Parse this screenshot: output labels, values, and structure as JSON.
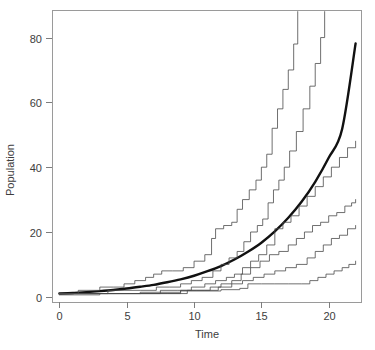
{
  "chart_data": {
    "type": "line",
    "title": "",
    "xlabel": "Time",
    "ylabel": "Population",
    "xlim": [
      -0.55,
      22.4
    ],
    "ylim": [
      -1.6,
      88.5
    ],
    "xticks": [
      0,
      5,
      10,
      15,
      20
    ],
    "xticklabels": [
      "0",
      "5",
      "10",
      "15",
      "20"
    ],
    "yticks": [
      0,
      20,
      40,
      60,
      80
    ],
    "yticklabels": [
      "0",
      "20",
      "40",
      "60",
      "80"
    ],
    "grid": false,
    "legend": null,
    "frame": "box",
    "background": "#ffffff",
    "colors": {
      "simulation_line": "#4a4a4a",
      "mean_line": "#111111",
      "axis": "#7d7d7d",
      "text": "#3d3d3d"
    },
    "series": [
      {
        "name": "Deterministic mean (exponential)",
        "kind": "smooth",
        "linewidth": 2.4,
        "color": "#111111",
        "x": [
          0,
          1,
          2,
          3,
          4,
          5,
          6,
          7,
          8,
          9,
          10,
          11,
          12,
          13,
          14,
          15,
          16,
          17,
          18,
          19,
          20,
          21,
          22
        ],
        "values": [
          1.0,
          1.2,
          1.45,
          1.75,
          2.1,
          2.55,
          3.1,
          3.7,
          4.5,
          5.4,
          6.5,
          7.9,
          9.5,
          11.5,
          13.9,
          16.7,
          20.2,
          24.4,
          29.4,
          35.5,
          42.9,
          51.8,
          78.2
        ]
      },
      {
        "name": "Simulation 1 (fastest)",
        "kind": "step",
        "linewidth": 0.8,
        "color": "#4a4a4a",
        "x": [
          0,
          1.0,
          1.4,
          2.2,
          3.0,
          4.0,
          4.8,
          5.6,
          6.4,
          7.0,
          7.6,
          8.4,
          9.2,
          10.0,
          10.8,
          11.3,
          11.6,
          12.2,
          12.8,
          13.2,
          13.6,
          14.1,
          14.6,
          15.0,
          15.4,
          15.8,
          16.2,
          16.6,
          17.0,
          17.4,
          17.7
        ],
        "values": [
          1,
          1,
          2,
          2,
          3,
          3,
          4,
          5,
          6,
          7,
          8,
          8,
          9,
          11,
          13,
          18,
          21,
          22,
          23,
          27,
          30,
          33,
          36,
          40,
          44,
          52,
          58,
          64,
          70,
          78,
          88
        ]
      },
      {
        "name": "Simulation 2",
        "kind": "step",
        "linewidth": 0.8,
        "color": "#4a4a4a",
        "x": [
          0,
          1.2,
          2.5,
          3.6,
          4.8,
          6.0,
          7.2,
          8.2,
          9.0,
          9.8,
          10.6,
          11.4,
          12.0,
          12.6,
          13.2,
          13.7,
          14.2,
          14.7,
          15.1,
          15.5,
          15.9,
          16.3,
          16.7,
          17.1,
          17.6,
          18.1,
          18.6,
          19.0,
          19.4,
          19.7
        ],
        "values": [
          1,
          1,
          1,
          2,
          2,
          2,
          3,
          3,
          4,
          5,
          6,
          8,
          10,
          12,
          14,
          17,
          20,
          22,
          24,
          29,
          33,
          36,
          40,
          45,
          51,
          58,
          65,
          72,
          80,
          88
        ]
      },
      {
        "name": "Simulation 3",
        "kind": "step",
        "linewidth": 0.8,
        "color": "#4a4a4a",
        "x": [
          0,
          1.5,
          3.0,
          4.5,
          6.0,
          7.5,
          8.8,
          9.8,
          10.8,
          11.6,
          12.4,
          13.0,
          13.6,
          14.2,
          14.8,
          15.4,
          16.0,
          16.6,
          17.2,
          17.8,
          18.4,
          19.0,
          19.6,
          20.2,
          20.8,
          21.4,
          22.0
        ],
        "values": [
          1,
          1,
          1,
          1,
          1,
          2,
          2,
          3,
          4,
          5,
          6,
          7,
          9,
          11,
          13,
          16,
          21,
          23,
          25,
          28,
          31,
          34,
          37,
          40,
          43,
          46,
          48
        ]
      },
      {
        "name": "Simulation 4",
        "kind": "step",
        "linewidth": 0.8,
        "color": "#4a4a4a",
        "x": [
          0,
          1.5,
          3.0,
          4.5,
          6.0,
          7.5,
          9.0,
          10.2,
          11.2,
          12.0,
          12.8,
          13.5,
          14.2,
          14.9,
          15.6,
          16.3,
          17.0,
          17.6,
          18.2,
          18.8,
          19.4,
          20.0,
          20.6,
          21.2,
          21.7,
          22.0
        ],
        "values": [
          1,
          1,
          1,
          1,
          1,
          1,
          2,
          2,
          3,
          4,
          5,
          7,
          9,
          11,
          13,
          14,
          16,
          18,
          20,
          22,
          23,
          25,
          26,
          28,
          29,
          30
        ]
      },
      {
        "name": "Simulation 5",
        "kind": "step",
        "linewidth": 0.8,
        "color": "#4a4a4a",
        "x": [
          0,
          2.0,
          4.0,
          6.0,
          8.0,
          9.5,
          10.8,
          11.8,
          12.8,
          13.6,
          14.4,
          15.2,
          16.0,
          16.8,
          17.6,
          18.4,
          19.0,
          19.6,
          20.2,
          20.8,
          21.4,
          22.0
        ],
        "values": [
          1,
          1,
          1,
          1,
          1,
          2,
          2,
          3,
          4,
          5,
          6,
          7,
          8,
          9,
          10,
          12,
          14,
          16,
          18,
          19,
          21,
          22
        ]
      },
      {
        "name": "Simulation 6 (slowest)",
        "kind": "step",
        "linewidth": 0.8,
        "color": "#4a4a4a",
        "x": [
          0,
          3.0,
          6.0,
          9.0,
          12.0,
          13.4,
          14.0,
          15.0,
          16.0,
          17.0,
          18.0,
          18.6,
          19.2,
          19.8,
          20.4,
          21.0,
          21.5,
          22.0
        ],
        "values": [
          0.6,
          1,
          1.4,
          1.8,
          2.2,
          2.6,
          4,
          4,
          4,
          4,
          4,
          5,
          6,
          7,
          8,
          9,
          10,
          11
        ]
      }
    ]
  },
  "axis": {
    "x_title": "Time",
    "y_title": "Population",
    "x_tick_labels": [
      "0",
      "5",
      "10",
      "15",
      "20"
    ],
    "y_tick_labels": [
      "0",
      "20",
      "40",
      "60",
      "80"
    ]
  }
}
